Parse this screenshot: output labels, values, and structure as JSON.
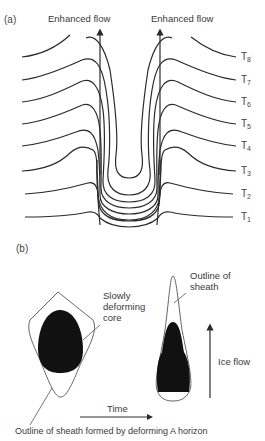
{
  "panel_a": {
    "label": "(a)",
    "arrow_labels": [
      "Enhanced flow",
      "Enhanced flow"
    ],
    "time_labels": [
      {
        "base": "T",
        "sub": "8"
      },
      {
        "base": "T",
        "sub": "7"
      },
      {
        "base": "T",
        "sub": "6"
      },
      {
        "base": "T",
        "sub": "5"
      },
      {
        "base": "T",
        "sub": "4"
      },
      {
        "base": "T",
        "sub": "3"
      },
      {
        "base": "T",
        "sub": "2"
      },
      {
        "base": "T",
        "sub": "1"
      }
    ]
  },
  "panel_b": {
    "label": "(b)",
    "core_label_lines": [
      "Slowly",
      "deforming",
      "core"
    ],
    "sheath_label_lines": [
      "Outline of",
      "sheath"
    ],
    "ice_flow_label": "Ice flow",
    "time_label": "Time",
    "caption": "Outline of sheath formed by deforming A horizon"
  },
  "colors": {
    "line": "#2a2a2a",
    "core_fill": "#111111",
    "text": "#3a3a3a"
  }
}
